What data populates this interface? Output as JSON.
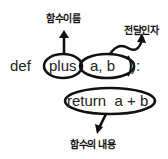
{
  "code": {
    "keyword": "def",
    "function_name": "plus",
    "params": "a, b",
    "closing": "):",
    "body": "return  a + b"
  },
  "annotations": {
    "function_name_label": "함수이름",
    "params_label": "전달인자",
    "body_label": "함수의 내용"
  },
  "colors": {
    "stroke": "#111111",
    "text": "#222222",
    "background": "#ffffff"
  }
}
